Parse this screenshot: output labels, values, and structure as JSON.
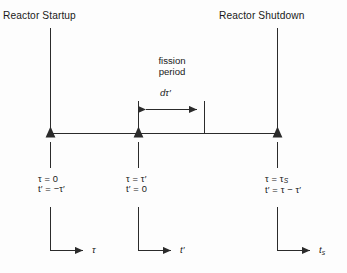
{
  "diagram": {
    "title_left": "Reactor Startup",
    "title_right": "Reactor Shutdown",
    "fission_period_line1": "fission",
    "fission_period_line2": "period",
    "interval_label": "dτ′",
    "line_color": "#2b2b2b",
    "background": "#fdfdfd",
    "events": [
      {
        "name": "startup",
        "eq_tau": "τ = 0",
        "eq_t": "t′ = −τ′",
        "axis_label": "τ",
        "axis_label_sub": ""
      },
      {
        "name": "fission",
        "eq_tau": "τ = τ′",
        "eq_t": "t′ = 0",
        "axis_label": "t′",
        "axis_label_sub": ""
      },
      {
        "name": "shutdown",
        "eq_tau": "τ = τ",
        "eq_tau_sub": "S",
        "eq_t": "t′ = τ − τ′",
        "axis_label": "t",
        "axis_label_sub": "s"
      }
    ]
  }
}
